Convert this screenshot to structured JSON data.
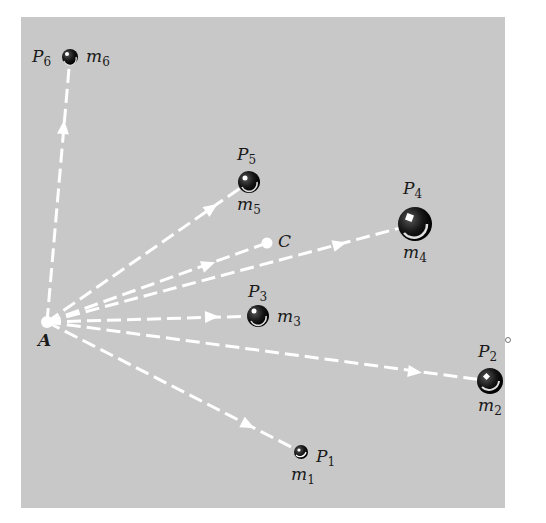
{
  "diagram": {
    "background": "#c8c8c8",
    "line_color": "#ffffff",
    "origin": {
      "label": "A",
      "x": 47,
      "y": 322
    },
    "center": {
      "label": "C",
      "x": 267,
      "y": 243
    },
    "points": [
      {
        "id": "P1",
        "label": "P",
        "sub": "1",
        "mass": "m",
        "msub": "1",
        "x": 301,
        "y": 452,
        "r": 7
      },
      {
        "id": "P2",
        "label": "P",
        "sub": "2",
        "mass": "m",
        "msub": "2",
        "x": 490,
        "y": 381,
        "r": 13
      },
      {
        "id": "P3",
        "label": "P",
        "sub": "3",
        "mass": "m",
        "msub": "3",
        "x": 258,
        "y": 316,
        "r": 11
      },
      {
        "id": "P4",
        "label": "P",
        "sub": "4",
        "mass": "m",
        "msub": "4",
        "x": 415,
        "y": 224,
        "r": 17
      },
      {
        "id": "P5",
        "label": "P",
        "sub": "5",
        "mass": "m",
        "msub": "5",
        "x": 249,
        "y": 182,
        "r": 11
      },
      {
        "id": "P6",
        "label": "P",
        "sub": "6",
        "mass": "m",
        "msub": "6",
        "x": 70,
        "y": 57,
        "r": 8
      }
    ]
  }
}
